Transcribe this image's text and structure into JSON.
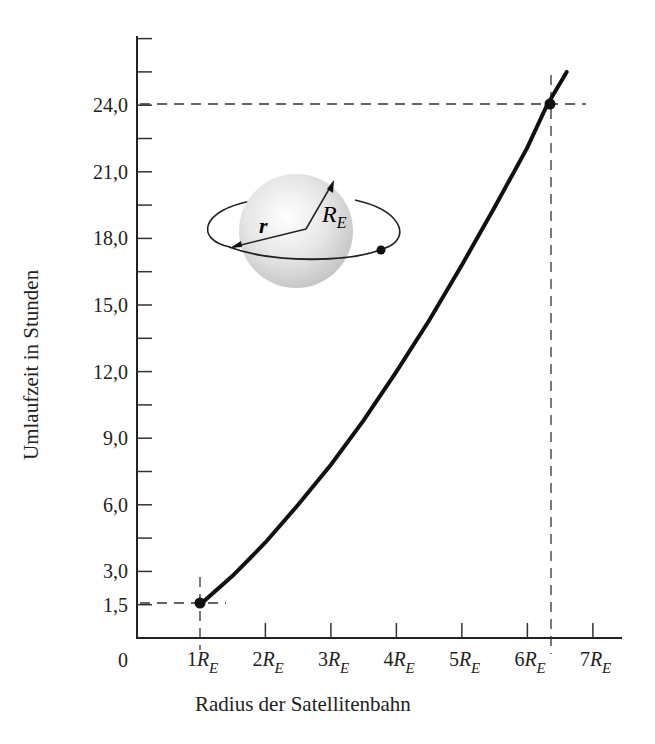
{
  "chart_data": {
    "type": "line",
    "title": "",
    "xlabel": "Radius der Satellitenbahn",
    "ylabel": "Umlaufzeit in Stunden",
    "x_origin_label": "0",
    "x_ticks": [
      {
        "value": 1,
        "num": "1",
        "sym": "R",
        "sub": "E"
      },
      {
        "value": 2,
        "num": "2",
        "sym": "R",
        "sub": "E"
      },
      {
        "value": 3,
        "num": "3",
        "sym": "R",
        "sub": "E"
      },
      {
        "value": 4,
        "num": "4",
        "sym": "R",
        "sub": "E"
      },
      {
        "value": 5,
        "num": "5",
        "sym": "R",
        "sub": "E"
      },
      {
        "value": 6,
        "num": "6",
        "sym": "R",
        "sub": "E"
      },
      {
        "value": 7,
        "num": "7",
        "sym": "R",
        "sub": "E"
      }
    ],
    "y_ticks": [
      {
        "value": 1.5,
        "label": "1,5"
      },
      {
        "value": 3.0,
        "label": "3,0"
      },
      {
        "value": 6.0,
        "label": "6,0"
      },
      {
        "value": 9.0,
        "label": "9,0"
      },
      {
        "value": 12.0,
        "label": "12,0"
      },
      {
        "value": 15.0,
        "label": "15,0"
      },
      {
        "value": 18.0,
        "label": "18,0"
      },
      {
        "value": 21.0,
        "label": "21,0"
      },
      {
        "value": 24.0,
        "label": "24,0"
      }
    ],
    "y_minor_ticks": [
      4.5,
      7.5,
      10.5,
      13.5,
      16.5,
      19.5,
      22.5,
      25.5,
      27.0
    ],
    "xlim": [
      0.0,
      7.35
    ],
    "ylim": [
      0,
      27.0
    ],
    "grid": false,
    "legend": null,
    "series": [
      {
        "name": "Umlaufzeit T(r) = 1,5 h · (r/R_E)^1.5",
        "x": [
          1.0,
          1.5,
          2.0,
          2.5,
          3.0,
          3.5,
          4.0,
          4.5,
          5.0,
          5.5,
          6.0,
          6.3,
          6.6
        ],
        "y": [
          1.5,
          2.8,
          4.3,
          6.0,
          7.8,
          9.8,
          12.0,
          14.3,
          16.8,
          19.4,
          22.1,
          24.0,
          25.5
        ]
      }
    ],
    "highlighted_points": [
      {
        "x": 1.0,
        "y": 1.5,
        "label": "1R_E, 1,5 h"
      },
      {
        "x": 6.3,
        "y": 24.0,
        "label": "≈6,3R_E, 24,0 h (geostationär)"
      }
    ],
    "annotations": {
      "inset": "Erde mit Satellitenbahn",
      "radius_label": "r",
      "earth_radius_label_sym": "R",
      "earth_radius_label_sub": "E"
    }
  }
}
